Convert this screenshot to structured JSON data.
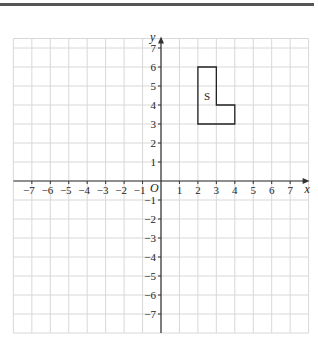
{
  "figure": {
    "axes": {
      "x_label": "x",
      "y_label": "y",
      "origin_label": "O",
      "x_range": [
        -8,
        8
      ],
      "y_range": [
        -8,
        7.5
      ],
      "x_ticks": [
        -7,
        -6,
        -5,
        -4,
        -3,
        -2,
        -1,
        1,
        2,
        3,
        4,
        5,
        6,
        7
      ],
      "y_ticks": [
        7,
        6,
        5,
        4,
        3,
        2,
        1,
        -1,
        -2,
        -3,
        -4,
        -5,
        -6,
        -7
      ]
    },
    "shape": {
      "label": "S",
      "vertices": [
        [
          2,
          3
        ],
        [
          2,
          6
        ],
        [
          3,
          6
        ],
        [
          3,
          4
        ],
        [
          4,
          4
        ],
        [
          4,
          3
        ]
      ]
    },
    "colors": {
      "grid": "#d8d8d8",
      "axis": "#333333",
      "shape": "#222222",
      "top_rule": "#555555"
    }
  }
}
